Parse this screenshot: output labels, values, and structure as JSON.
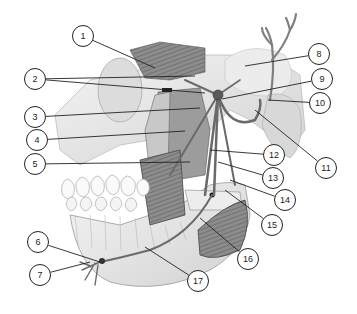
{
  "figure": {
    "style": "grayscale pencil anatomical illustration",
    "colors": {
      "background": "#ffffff",
      "line": "#222222",
      "bone": "#e6e6e6",
      "muscle": "#8a8a8a",
      "nerve": "#6f6f6f",
      "shadow": "#bdbdbd"
    }
  },
  "labels": [
    {
      "id": "1",
      "text": "1",
      "cx": 83,
      "cy": 36,
      "targets": [
        [
          155,
          68
        ]
      ]
    },
    {
      "id": "2",
      "text": "2",
      "cx": 35,
      "cy": 79,
      "targets": [
        [
          195,
          76
        ],
        [
          205,
          93
        ]
      ]
    },
    {
      "id": "3",
      "text": "3",
      "cx": 35,
      "cy": 117,
      "targets": [
        [
          200,
          108
        ]
      ]
    },
    {
      "id": "4",
      "text": "4",
      "cx": 37,
      "cy": 140,
      "targets": [
        [
          185,
          131
        ]
      ]
    },
    {
      "id": "5",
      "text": "5",
      "cx": 35,
      "cy": 164,
      "targets": [
        [
          190,
          162
        ]
      ]
    },
    {
      "id": "6",
      "text": "6",
      "cx": 38,
      "cy": 242,
      "targets": [
        [
          100,
          262
        ]
      ]
    },
    {
      "id": "7",
      "text": "7",
      "cx": 40,
      "cy": 275,
      "targets": [
        [
          90,
          262
        ]
      ]
    },
    {
      "id": "8",
      "text": "8",
      "cx": 319,
      "cy": 54,
      "targets": [
        [
          245,
          66
        ]
      ]
    },
    {
      "id": "9",
      "text": "9",
      "cx": 322,
      "cy": 79,
      "targets": [
        [
          222,
          99
        ]
      ]
    },
    {
      "id": "10",
      "text": "10",
      "cx": 320,
      "cy": 103,
      "targets": [
        [
          268,
          100
        ]
      ]
    },
    {
      "id": "11",
      "text": "11",
      "cx": 326,
      "cy": 168,
      "targets": [
        [
          255,
          110
        ]
      ]
    },
    {
      "id": "12",
      "text": "12",
      "cx": 274,
      "cy": 155,
      "targets": [
        [
          210,
          150
        ]
      ]
    },
    {
      "id": "13",
      "text": "13",
      "cx": 273,
      "cy": 178,
      "targets": [
        [
          218,
          162
        ]
      ]
    },
    {
      "id": "14",
      "text": "14",
      "cx": 285,
      "cy": 200,
      "targets": [
        [
          230,
          180
        ]
      ]
    },
    {
      "id": "15",
      "text": "15",
      "cx": 272,
      "cy": 225,
      "targets": [
        [
          225,
          190
        ]
      ]
    },
    {
      "id": "16",
      "text": "16",
      "cx": 248,
      "cy": 259,
      "targets": [
        [
          200,
          218
        ]
      ]
    },
    {
      "id": "17",
      "text": "17",
      "cx": 198,
      "cy": 281,
      "targets": [
        [
          145,
          247
        ]
      ]
    }
  ],
  "landmarks": {
    "ganglion": [
      218,
      95
    ],
    "mandibular_foramen": [
      212,
      195
    ],
    "mental_foramen": [
      102,
      261
    ]
  }
}
